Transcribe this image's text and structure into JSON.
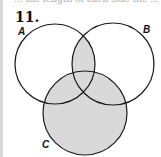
{
  "header": {
    "cropped_text": "... the length of each side the ...",
    "problem_number": "11."
  },
  "diagram": {
    "type": "venn",
    "sets": [
      {
        "label": "A",
        "cx": 55,
        "cy": 64,
        "r": 40
      },
      {
        "label": "B",
        "cx": 113,
        "cy": 64,
        "r": 41
      },
      {
        "label": "C",
        "cx": 85,
        "cy": 113,
        "r": 42
      }
    ],
    "shaded_regions": "(A ∩ B) ∪ C",
    "shade_color": "#d9d9d9",
    "stroke_color": "#1a1a1a"
  }
}
